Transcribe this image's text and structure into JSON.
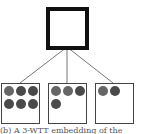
{
  "diagram": {
    "root": {
      "label": ""
    },
    "children": [
      {
        "dots": 6
      },
      {
        "dots": 4
      },
      {
        "dots": 2
      }
    ],
    "colors": {
      "border": "#111111",
      "edge": "#777777",
      "dot": "#4a4a4a"
    }
  },
  "caption": "(b) A 3-WTT embedding of the"
}
